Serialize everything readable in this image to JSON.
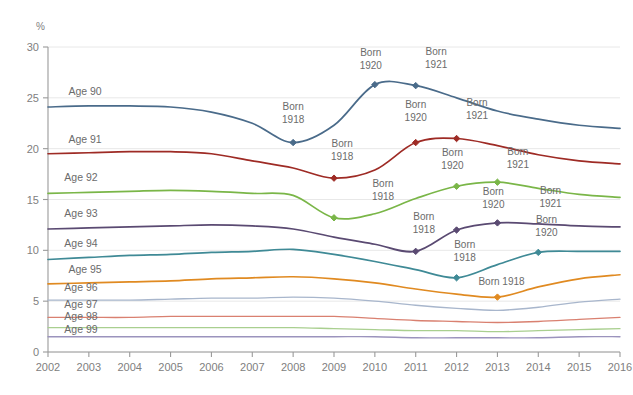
{
  "chart_data": {
    "type": "line",
    "title": "",
    "subtitle": "",
    "xlabel": "",
    "ylabel": "%",
    "unit_label": "%",
    "grid": true,
    "legend": "inline-series-labels",
    "xlim": [
      2002,
      2016
    ],
    "ylim": [
      0,
      30
    ],
    "yticks": [
      0,
      5,
      10,
      15,
      20,
      25,
      30
    ],
    "ytick_labels": [
      "0",
      "5",
      "10",
      "15",
      "20",
      "25",
      "30"
    ],
    "x": [
      2002,
      2003,
      2004,
      2005,
      2006,
      2007,
      2008,
      2009,
      2010,
      2011,
      2012,
      2013,
      2014,
      2015,
      2016
    ],
    "xtick_labels": [
      "2002",
      "2003",
      "2004",
      "2005",
      "2006",
      "2007",
      "2008",
      "2009",
      "2010",
      "2011",
      "2012",
      "2013",
      "2014",
      "2015",
      "2016"
    ],
    "series": [
      {
        "name": "Age 90",
        "color": "#4a6b8a",
        "values": [
          24.1,
          24.2,
          24.2,
          24.1,
          23.6,
          22.5,
          20.6,
          22.3,
          26.3,
          26.2,
          25.0,
          23.7,
          22.9,
          22.3,
          22.0
        ],
        "markers": [
          {
            "x": 2008,
            "y": 20.6
          },
          {
            "x": 2010,
            "y": 26.3
          },
          {
            "x": 2011,
            "y": 26.2
          }
        ]
      },
      {
        "name": "Age 91",
        "color": "#9e2b25",
        "values": [
          19.5,
          19.6,
          19.7,
          19.7,
          19.5,
          18.8,
          18.1,
          17.1,
          17.9,
          20.6,
          21.0,
          20.3,
          19.4,
          18.8,
          18.5
        ],
        "markers": [
          {
            "x": 2009,
            "y": 17.1
          },
          {
            "x": 2011,
            "y": 20.6
          },
          {
            "x": 2012,
            "y": 21.0
          }
        ]
      },
      {
        "name": "Age 92",
        "color": "#7ab648",
        "values": [
          15.6,
          15.7,
          15.8,
          15.9,
          15.8,
          15.6,
          15.4,
          13.2,
          13.6,
          15.1,
          16.3,
          16.7,
          16.1,
          15.5,
          15.2
        ],
        "markers": [
          {
            "x": 2009,
            "y": 13.2
          },
          {
            "x": 2012,
            "y": 16.3
          },
          {
            "x": 2013,
            "y": 16.7
          }
        ]
      },
      {
        "name": "Age 93",
        "color": "#5a4a72",
        "values": [
          12.1,
          12.2,
          12.3,
          12.4,
          12.5,
          12.4,
          12.1,
          11.3,
          10.6,
          9.9,
          12.0,
          12.7,
          12.6,
          12.4,
          12.3
        ],
        "markers": [
          {
            "x": 2011,
            "y": 9.9
          },
          {
            "x": 2012,
            "y": 12.0
          },
          {
            "x": 2013,
            "y": 12.7
          }
        ]
      },
      {
        "name": "Age 94",
        "color": "#3f8a96",
        "values": [
          9.1,
          9.3,
          9.5,
          9.6,
          9.8,
          9.9,
          10.1,
          9.6,
          8.9,
          8.1,
          7.3,
          8.6,
          9.8,
          9.9,
          9.9
        ],
        "markers": [
          {
            "x": 2012,
            "y": 7.3
          },
          {
            "x": 2014,
            "y": 9.8
          }
        ]
      },
      {
        "name": "Age 95",
        "color": "#e08a21",
        "values": [
          6.7,
          6.8,
          6.9,
          7.0,
          7.2,
          7.3,
          7.4,
          7.2,
          6.8,
          6.2,
          5.7,
          5.4,
          6.4,
          7.2,
          7.6
        ],
        "markers": [
          {
            "x": 2013,
            "y": 5.4
          }
        ]
      },
      {
        "name": "Age 96",
        "color": "#a8b6cc",
        "values": [
          5.1,
          5.1,
          5.1,
          5.2,
          5.3,
          5.3,
          5.4,
          5.3,
          5.0,
          4.6,
          4.3,
          4.1,
          4.4,
          4.9,
          5.2
        ],
        "markers": []
      },
      {
        "name": "Age 97",
        "color": "#d98070",
        "values": [
          3.4,
          3.4,
          3.4,
          3.5,
          3.5,
          3.5,
          3.5,
          3.5,
          3.3,
          3.1,
          3.0,
          2.9,
          3.0,
          3.2,
          3.4
        ],
        "markers": []
      },
      {
        "name": "Age 98",
        "color": "#a9cf8f",
        "values": [
          2.4,
          2.4,
          2.4,
          2.4,
          2.4,
          2.4,
          2.4,
          2.3,
          2.2,
          2.1,
          2.1,
          2.0,
          2.1,
          2.2,
          2.3
        ],
        "markers": []
      },
      {
        "name": "Age 99",
        "color": "#9b93bd",
        "values": [
          1.5,
          1.5,
          1.5,
          1.5,
          1.5,
          1.5,
          1.5,
          1.5,
          1.5,
          1.4,
          1.4,
          1.4,
          1.4,
          1.5,
          1.5
        ],
        "markers": []
      }
    ],
    "series_labels": [
      {
        "text": "Age 90",
        "x": 2002.5,
        "y": 25.3
      },
      {
        "text": "Age 91",
        "x": 2002.5,
        "y": 20.6
      },
      {
        "text": "Age 92",
        "x": 2002.4,
        "y": 16.8
      },
      {
        "text": "Age 93",
        "x": 2002.4,
        "y": 13.3
      },
      {
        "text": "Age 94",
        "x": 2002.4,
        "y": 10.3
      },
      {
        "text": "Age 95",
        "x": 2002.5,
        "y": 7.8
      },
      {
        "text": "Age 96",
        "x": 2002.4,
        "y": 6.0
      },
      {
        "text": "Age 97",
        "x": 2002.4,
        "y": 4.3
      },
      {
        "text": "Age 98",
        "x": 2002.4,
        "y": 3.1
      },
      {
        "text": "Age 99",
        "x": 2002.4,
        "y": 1.9
      }
    ],
    "annotations": [
      {
        "line1": "Born",
        "line2": "1918",
        "x": 2008.0,
        "y": 23.8,
        "series": "Age 90"
      },
      {
        "line1": "Born",
        "line2": "1920",
        "x": 2009.9,
        "y": 29.1,
        "series": "Age 90"
      },
      {
        "line1": "Born",
        "line2": "1921",
        "x": 2011.5,
        "y": 29.2,
        "series": "Age 90"
      },
      {
        "line1": "Born",
        "line2": "1918",
        "x": 2009.2,
        "y": 20.2,
        "series": "Age 91"
      },
      {
        "line1": "Born",
        "line2": "1920",
        "x": 2011.0,
        "y": 24.0,
        "series": "Age 91"
      },
      {
        "line1": "Born",
        "line2": "1921",
        "x": 2012.5,
        "y": 24.2,
        "series": "Age 91"
      },
      {
        "line1": "Born",
        "line2": "1918",
        "x": 2010.2,
        "y": 16.2,
        "series": "Age 92"
      },
      {
        "line1": "Born",
        "line2": "1920",
        "x": 2011.9,
        "y": 19.3,
        "series": "Age 92"
      },
      {
        "line1": "Born",
        "line2": "1921",
        "x": 2013.5,
        "y": 19.4,
        "series": "Age 92"
      },
      {
        "line1": "Born",
        "line2": "1918",
        "x": 2011.2,
        "y": 13.0,
        "series": "Age 93"
      },
      {
        "line1": "Born",
        "line2": "1920",
        "x": 2012.9,
        "y": 15.4,
        "series": "Age 93"
      },
      {
        "line1": "Born",
        "line2": "1921",
        "x": 2014.3,
        "y": 15.5,
        "series": "Age 93"
      },
      {
        "line1": "Born",
        "line2": "1918",
        "x": 2012.2,
        "y": 10.2,
        "series": "Age 94"
      },
      {
        "line1": "Born",
        "line2": "1920",
        "x": 2014.2,
        "y": 12.7,
        "series": "Age 94"
      },
      {
        "line1": "Born 1918",
        "line2": "",
        "x": 2013.1,
        "y": 6.6,
        "series": "Age 95"
      }
    ]
  }
}
